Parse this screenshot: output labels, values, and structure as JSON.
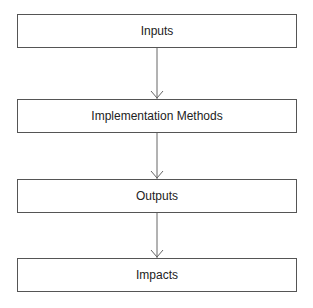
{
  "diagram": {
    "type": "flowchart",
    "direction": "top-to-bottom",
    "nodes": [
      {
        "id": "inputs",
        "label": "Inputs"
      },
      {
        "id": "implementation_methods",
        "label": "Implementation Methods"
      },
      {
        "id": "outputs",
        "label": "Outputs"
      },
      {
        "id": "impacts",
        "label": "Impacts"
      }
    ],
    "edges": [
      {
        "from": "inputs",
        "to": "implementation_methods"
      },
      {
        "from": "implementation_methods",
        "to": "outputs"
      },
      {
        "from": "outputs",
        "to": "impacts"
      }
    ],
    "colors": {
      "stroke": "#555555",
      "text": "#222222",
      "background": "#ffffff"
    }
  }
}
